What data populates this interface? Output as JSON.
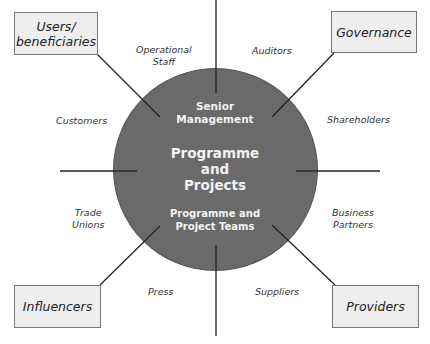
{
  "diagram": {
    "center": {
      "top_label": [
        "Senior",
        "Management"
      ],
      "main_label": [
        "Programme",
        "and",
        "Projects"
      ],
      "bottom_label": [
        "Programme and",
        "Project Teams"
      ],
      "fill_color": "#6a6a6a",
      "text_color": "#f2f2f2"
    },
    "boxes": {
      "users": [
        "Users/",
        "beneficiaries"
      ],
      "governance": "Governance",
      "influencers": "Influencers",
      "providers": "Providers",
      "fill_color": "#eeeeee"
    },
    "stakeholders": {
      "operational_staff": [
        "Operational",
        "Staff"
      ],
      "auditors": "Auditors",
      "customers": "Customers",
      "shareholders": "Shareholders",
      "trade_unions": [
        "Trade",
        "Unions"
      ],
      "business_partners": [
        "Business",
        "Partners"
      ],
      "press": "Press",
      "suppliers": "Suppliers"
    }
  }
}
